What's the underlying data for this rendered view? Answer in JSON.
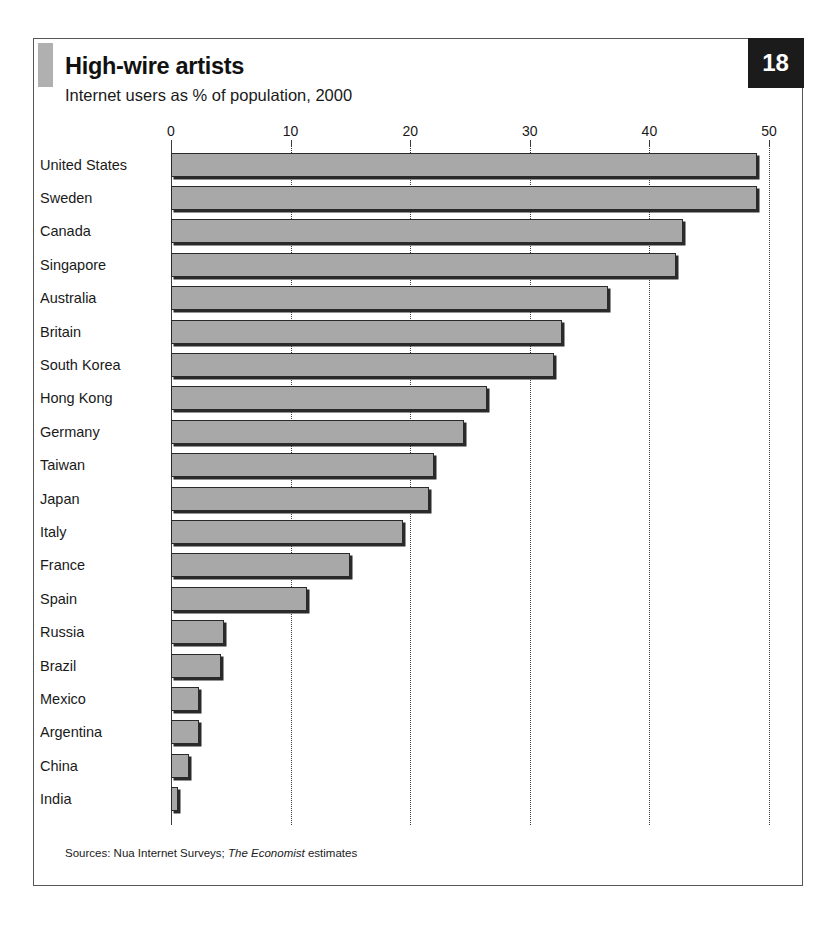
{
  "figure": {
    "title": "High-wire artists",
    "subtitle": "Internet users as % of population, 2000",
    "page_number": "18",
    "sources_prefix": "Sources: Nua Internet Surveys;",
    "sources_italic": "The Economist",
    "sources_suffix": "estimates",
    "accent_color": "#b0b0b0",
    "bar_fill_color": "#a8a8a8",
    "bar_edge_color": "#2a2a2a",
    "badge_color": "#1b1b1b"
  },
  "chart_data": {
    "type": "bar",
    "orientation": "horizontal",
    "title": "High-wire artists",
    "subtitle": "Internet users as % of population, 2000",
    "xlabel": "",
    "ylabel": "",
    "xlim": [
      0,
      50
    ],
    "xticks": [
      0,
      10,
      20,
      30,
      40,
      50
    ],
    "xtick_labels": [
      "0",
      "10",
      "20",
      "30",
      "40",
      "50"
    ],
    "grid": "vertical-dotted",
    "legend": "none",
    "unit": "% of population",
    "year": 2000,
    "categories": [
      "United States",
      "Sweden",
      "Canada",
      "Singapore",
      "Australia",
      "Britain",
      "South Korea",
      "Hong Kong",
      "Germany",
      "Taiwan",
      "Japan",
      "Italy",
      "France",
      "Spain",
      "Russia",
      "Brazil",
      "Mexico",
      "Argentina",
      "China",
      "India"
    ],
    "values": [
      49.0,
      49.0,
      42.8,
      42.2,
      36.5,
      32.7,
      32.0,
      26.4,
      24.5,
      22.0,
      21.6,
      19.4,
      15.0,
      11.4,
      4.4,
      4.2,
      2.3,
      2.3,
      1.5,
      0.6
    ]
  }
}
